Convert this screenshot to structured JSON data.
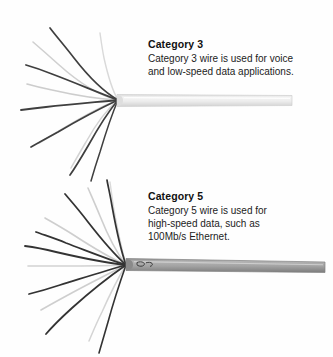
{
  "figure": {
    "name": "twisted-pair-cable-comparison",
    "background_color": "#fefefe"
  },
  "cables": [
    {
      "id": "cat3",
      "label": "Category 3 cable",
      "jacket_color": "#e8e8e8",
      "jacket_edge_color": "#cfcfcf",
      "wire_dark_color": "#3a3a3a",
      "wire_light_color": "#b8b8b8",
      "strand_count": 8
    },
    {
      "id": "cat5",
      "label": "Category 5 cable",
      "jacket_color": "#9a9a9a",
      "jacket_edge_color": "#7d7d7d",
      "wire_dark_color": "#333333",
      "wire_light_color": "#bdbdbd",
      "strand_count": 8
    }
  ],
  "captions": {
    "cat3": {
      "title": "Category 3",
      "body": "Category 3 wire is used for voice\nand low-speed data applications."
    },
    "cat5": {
      "title": "Category 5",
      "body": "Category 5 wire is used for\nhigh-speed data, such as\n100Mb/s Ethernet."
    }
  }
}
